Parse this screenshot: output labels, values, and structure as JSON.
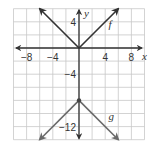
{
  "chart_data": {
    "type": "line",
    "title": "",
    "xlabel": "x",
    "ylabel": "y",
    "xlim": [
      -10,
      10
    ],
    "ylim": [
      -14,
      6
    ],
    "grid": true,
    "grid_step": 2,
    "x_ticks": [
      {
        "value": -8,
        "label": "−8"
      },
      {
        "value": -4,
        "label": "−4"
      },
      {
        "value": 4,
        "label": "4"
      },
      {
        "value": 8,
        "label": "8"
      }
    ],
    "y_ticks": [
      {
        "value": 4,
        "label": "4"
      },
      {
        "value": -4,
        "label": "−4"
      },
      {
        "value": -12,
        "label": "−12"
      }
    ],
    "series": [
      {
        "name": "f",
        "expression": "f(x) = |x|",
        "color": "#333333",
        "points": [
          [
            -6,
            6
          ],
          [
            0,
            0
          ],
          [
            6,
            6
          ]
        ],
        "vertex": [
          0,
          0
        ],
        "label_pos": [
          4.5,
          3
        ]
      },
      {
        "name": "g",
        "expression": "g(x) = -|x| - 8",
        "color": "#666666",
        "points": [
          [
            -6,
            -14
          ],
          [
            0,
            -8
          ],
          [
            6,
            -14
          ]
        ],
        "vertex": [
          0,
          -8
        ],
        "label_pos": [
          4.5,
          -11
        ]
      }
    ]
  },
  "labels": {
    "x_axis": "x",
    "y_axis": "y",
    "f": "f",
    "g": "g"
  },
  "colors": {
    "grid": "#c8c8c8",
    "axis": "#333333",
    "f_line": "#333333",
    "g_line": "#6a6a6a",
    "text": "#333333"
  }
}
